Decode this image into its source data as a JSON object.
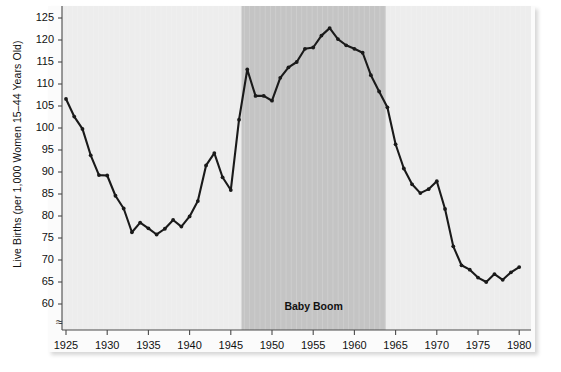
{
  "chart": {
    "type": "line",
    "ylabel": "Live Births (per 1,000 Women 15–44 Years Old)",
    "xlabel": "",
    "title": "",
    "annotation_label": "Baby Boom",
    "axis_break_symbol": "≈",
    "y_ticks": [
      125,
      120,
      115,
      110,
      105,
      100,
      95,
      90,
      85,
      80,
      75,
      70,
      65,
      60
    ],
    "x_ticks": [
      1925,
      1930,
      1935,
      1940,
      1945,
      1950,
      1955,
      1960,
      1965,
      1970,
      1975,
      1980
    ],
    "ylim": [
      57,
      127
    ],
    "xlim": [
      1924,
      1981
    ],
    "grid": false,
    "legend": false,
    "line_color": "#1a1a1a",
    "marker_color": "#1a1a1a",
    "plot_bg": "#ededed",
    "band_bg": "#c4c4c4",
    "page_bg": "#fbfbfb",
    "shaded_band": {
      "label": "Baby Boom",
      "x_start": 1946.3,
      "x_end": 1963.8
    }
  },
  "chart_data": {
    "type": "line",
    "title": "",
    "xlabel": "",
    "ylabel": "Live Births (per 1,000 Women 15–44 Years Old)",
    "xlim": [
      1924,
      1981
    ],
    "ylim": [
      57,
      127
    ],
    "grid": false,
    "legend": false,
    "annotations": [
      {
        "text": "Baby Boom",
        "x_start": 1946,
        "x_end": 1964
      }
    ],
    "x": [
      1925,
      1926,
      1927,
      1928,
      1929,
      1930,
      1931,
      1932,
      1933,
      1934,
      1935,
      1936,
      1937,
      1938,
      1939,
      1940,
      1941,
      1942,
      1943,
      1944,
      1945,
      1946,
      1947,
      1948,
      1949,
      1950,
      1951,
      1952,
      1953,
      1954,
      1955,
      1956,
      1957,
      1958,
      1959,
      1960,
      1961,
      1962,
      1963,
      1964,
      1965,
      1966,
      1967,
      1968,
      1969,
      1970,
      1971,
      1972,
      1973,
      1974,
      1975,
      1976,
      1977,
      1978,
      1979,
      1980
    ],
    "y": [
      106.6,
      102.6,
      99.8,
      93.8,
      89.3,
      89.2,
      84.6,
      81.7,
      76.3,
      78.5,
      77.2,
      75.8,
      77.1,
      79.1,
      77.6,
      79.9,
      83.4,
      91.5,
      94.3,
      88.8,
      85.9,
      101.9,
      113.3,
      107.3,
      107.3,
      106.2,
      111.4,
      113.8,
      115.0,
      118.0,
      118.3,
      121.0,
      122.7,
      120.2,
      118.8,
      118.0,
      117.1,
      112.0,
      108.3,
      104.7,
      96.3,
      90.8,
      87.2,
      85.2,
      86.1,
      87.9,
      81.6,
      73.1,
      68.8,
      67.8,
      66.0,
      65.0,
      66.8,
      65.5,
      67.2,
      68.4,
      67.4,
      68.4,
      66.5,
      66.1,
      67.0,
      68.4
    ],
    "series": [
      {
        "name": "Live births per 1,000 women aged 15–44",
        "values": [
          106.6,
          102.6,
          99.8,
          93.8,
          89.3,
          89.2,
          84.6,
          81.7,
          76.3,
          78.5,
          77.2,
          75.8,
          77.1,
          79.1,
          77.6,
          79.9,
          83.4,
          91.5,
          94.3,
          88.8,
          85.9,
          101.9,
          113.3,
          107.3,
          107.3,
          106.2,
          111.4,
          113.8,
          115.0,
          118.0,
          118.3,
          121.0,
          122.7,
          120.2,
          118.8,
          118.0,
          117.1,
          112.0,
          108.3,
          104.7,
          96.3,
          90.8,
          87.2,
          85.2,
          86.1,
          87.9,
          81.6,
          73.1,
          68.8,
          67.8,
          66.0,
          65.0,
          66.8,
          65.5,
          67.2,
          68.4
        ]
      }
    ]
  }
}
